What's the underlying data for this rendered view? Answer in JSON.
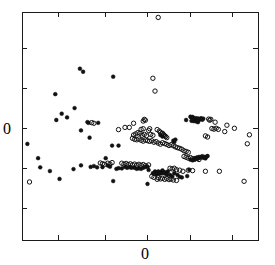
{
  "chart_data": {
    "type": "scatter",
    "title": "",
    "subtitle": "",
    "xlabel": "",
    "ylabel": "",
    "xlim": [
      -3,
      2
    ],
    "ylim": [
      -2,
      3
    ],
    "grid": false,
    "legend_position": "none",
    "xticks": [
      -3,
      -2,
      -1,
      0,
      1
    ],
    "xtick_labels": [
      "",
      "",
      "",
      "0",
      ""
    ],
    "yticks": [
      2,
      1,
      0,
      -1,
      -2
    ],
    "ytick_labels": [
      "",
      "",
      "0",
      "",
      ""
    ],
    "axis_frame": "box",
    "tick_direction": "in",
    "x_axis_label_value": "0",
    "y_axis_label_value": "0",
    "marker_colors": {
      "filled": "#111111",
      "open": "#111111"
    },
    "series": [
      {
        "name": "filled",
        "marker": "filled-circle",
        "points": [
          [
            -1.773,
            1.757
          ],
          [
            -1.705,
            1.69
          ],
          [
            -1.068,
            1.581
          ],
          [
            -2.295,
            1.199
          ],
          [
            -1.886,
            0.893
          ],
          [
            -2.159,
            0.77
          ],
          [
            -2.045,
            0.689
          ],
          [
            -2.273,
            0.632
          ],
          [
            -1.614,
            0.585
          ],
          [
            -1.591,
            0.57
          ],
          [
            -1.386,
            0.57
          ],
          [
            -1.75,
            0.403
          ],
          [
            -1.568,
            0.245
          ],
          [
            -2.886,
            0.108
          ],
          [
            -1.091,
            0.07
          ],
          [
            -0.955,
            0.07
          ],
          [
            -2.659,
            -0.206
          ],
          [
            -2.614,
            -0.407
          ],
          [
            -1.909,
            -0.445
          ],
          [
            -2.409,
            -0.488
          ],
          [
            -1.227,
            -0.206
          ],
          [
            -1.75,
            -0.363
          ],
          [
            -1.545,
            -0.397
          ],
          [
            -1.477,
            -0.378
          ],
          [
            -1.409,
            -0.406
          ],
          [
            -1.295,
            -0.402
          ],
          [
            -1.182,
            -0.368
          ],
          [
            -1.136,
            -0.392
          ],
          [
            -1.0,
            -0.44
          ],
          [
            -0.955,
            -0.425
          ],
          [
            -0.886,
            -0.43
          ],
          [
            -0.818,
            -0.397
          ],
          [
            -0.773,
            -0.416
          ],
          [
            -0.727,
            -0.402
          ],
          [
            -0.682,
            -0.416
          ],
          [
            -0.614,
            -0.416
          ],
          [
            -0.568,
            -0.44
          ],
          [
            -0.523,
            -0.426
          ],
          [
            -0.477,
            -0.44
          ],
          [
            -0.432,
            -0.416
          ],
          [
            -0.386,
            -0.397
          ],
          [
            -0.341,
            -0.392
          ],
          [
            -2.205,
            -0.66
          ],
          [
            -1.068,
            -0.707
          ],
          [
            -0.318,
            -0.464
          ],
          [
            -0.227,
            -0.536
          ],
          [
            -0.182,
            -0.498
          ],
          [
            -0.159,
            -0.56
          ],
          [
            -0.136,
            -0.522
          ],
          [
            -0.114,
            -0.498
          ],
          [
            -0.091,
            -0.55
          ],
          [
            -0.068,
            -0.507
          ],
          [
            -0.045,
            -0.536
          ],
          [
            -0.023,
            -0.474
          ],
          [
            0.0,
            -0.512
          ],
          [
            0.023,
            -0.541
          ],
          [
            0.045,
            -0.517
          ],
          [
            0.068,
            -0.565
          ],
          [
            0.091,
            -0.498
          ],
          [
            0.136,
            -0.574
          ],
          [
            0.182,
            -0.603
          ],
          [
            0.227,
            -0.536
          ],
          [
            0.295,
            -0.574
          ],
          [
            0.341,
            -0.617
          ],
          [
            -0.341,
            -0.77
          ],
          [
            0.386,
            -0.627
          ],
          [
            0.5,
            -0.598
          ],
          [
            0.545,
            -0.459
          ],
          [
            0.568,
            -0.239
          ],
          [
            0.614,
            -0.253
          ],
          [
            0.636,
            -0.234
          ],
          [
            0.659,
            -0.206
          ],
          [
            0.682,
            -0.22
          ],
          [
            0.705,
            -0.191
          ],
          [
            0.727,
            -0.215
          ],
          [
            0.75,
            -0.177
          ],
          [
            0.773,
            -0.196
          ],
          [
            0.795,
            -0.182
          ],
          [
            0.818,
            -0.163
          ],
          [
            0.841,
            -0.196
          ],
          [
            0.864,
            -0.177
          ],
          [
            0.886,
            -0.211
          ],
          [
            0.909,
            -0.172
          ],
          [
            0.932,
            -0.158
          ],
          [
            0.568,
            0.704
          ],
          [
            0.591,
            0.68
          ],
          [
            0.614,
            0.699
          ],
          [
            0.636,
            0.675
          ],
          [
            0.659,
            0.646
          ],
          [
            0.682,
            0.67
          ],
          [
            0.705,
            0.651
          ],
          [
            0.727,
            0.665
          ],
          [
            0.75,
            0.632
          ],
          [
            0.773,
            0.656
          ],
          [
            0.795,
            0.67
          ],
          [
            0.818,
            0.637
          ],
          [
            0.841,
            0.661
          ],
          [
            0.636,
            0.608
          ],
          [
            0.591,
            0.613
          ],
          [
            0.682,
            0.603
          ],
          [
            0.727,
            0.584
          ],
          [
            -0.068,
            0.302
          ],
          [
            -0.023,
            0.268
          ],
          [
            0.205,
            0.178
          ],
          [
            0.227,
            0.15
          ],
          [
            0.25,
            0.202
          ],
          [
            0.477,
            0.632
          ]
        ]
      },
      {
        "name": "open",
        "marker": "open-circle",
        "points": [
          [
            -0.114,
            2.881
          ],
          [
            -0.227,
            1.547
          ],
          [
            -0.182,
            1.266
          ],
          [
            -2.841,
            -0.727
          ],
          [
            -1.523,
            0.574
          ],
          [
            -1.477,
            0.56
          ],
          [
            -0.432,
            0.608
          ],
          [
            -0.409,
            0.646
          ],
          [
            -0.386,
            0.627
          ],
          [
            -0.636,
            0.56
          ],
          [
            -0.818,
            0.469
          ],
          [
            -0.727,
            0.469
          ],
          [
            -0.955,
            0.421
          ],
          [
            -0.477,
            0.426
          ],
          [
            -0.432,
            0.44
          ],
          [
            -0.295,
            0.44
          ],
          [
            -0.318,
            0.402
          ],
          [
            -0.545,
            0.355
          ],
          [
            -0.5,
            0.34
          ],
          [
            -0.591,
            0.326
          ],
          [
            -0.636,
            0.302
          ],
          [
            -0.455,
            0.297
          ],
          [
            -0.409,
            0.316
          ],
          [
            -0.364,
            0.287
          ],
          [
            -0.273,
            0.316
          ],
          [
            -0.227,
            0.297
          ],
          [
            -0.136,
            0.421
          ],
          [
            -0.091,
            0.388
          ],
          [
            -0.068,
            0.359
          ],
          [
            -0.045,
            0.33
          ],
          [
            -0.023,
            0.34
          ],
          [
            0.0,
            0.311
          ],
          [
            0.023,
            0.287
          ],
          [
            0.045,
            0.268
          ],
          [
            0.068,
            0.244
          ],
          [
            -0.659,
            0.23
          ],
          [
            -0.614,
            0.206
          ],
          [
            -0.568,
            0.197
          ],
          [
            -0.523,
            0.216
          ],
          [
            -0.477,
            0.187
          ],
          [
            -0.432,
            0.168
          ],
          [
            -0.386,
            0.192
          ],
          [
            -0.341,
            0.178
          ],
          [
            -0.295,
            0.163
          ],
          [
            -0.25,
            0.178
          ],
          [
            -0.205,
            0.144
          ],
          [
            -0.159,
            0.158
          ],
          [
            -0.114,
            0.125
          ],
          [
            -0.068,
            0.101
          ],
          [
            -0.023,
            0.134
          ],
          [
            0.023,
            0.115
          ],
          [
            0.068,
            0.096
          ],
          [
            0.114,
            0.072
          ],
          [
            0.159,
            0.091
          ],
          [
            0.205,
            0.067
          ],
          [
            0.25,
            0.043
          ],
          [
            0.295,
            0.024
          ],
          [
            0.341,
            0.01
          ],
          [
            0.386,
            -0.01
          ],
          [
            0.432,
            -0.043
          ],
          [
            0.477,
            -0.058
          ],
          [
            0.523,
            -0.077
          ],
          [
            0.432,
            -0.168
          ],
          [
            0.477,
            -0.187
          ],
          [
            0.523,
            -0.206
          ],
          [
            0.568,
            -0.192
          ],
          [
            0.614,
            -0.216
          ],
          [
            0.659,
            -0.23
          ],
          [
            0.705,
            -0.211
          ],
          [
            0.75,
            -0.235
          ],
          [
            1.091,
            0.584
          ],
          [
            1.023,
            0.445
          ],
          [
            1.068,
            0.431
          ],
          [
            1.114,
            0.45
          ],
          [
            1.159,
            0.426
          ],
          [
            1.341,
            0.517
          ],
          [
            1.295,
            0.378
          ],
          [
            1.5,
            0.45
          ],
          [
            0.955,
            0.651
          ],
          [
            0.977,
            0.627
          ],
          [
            1.0,
            0.646
          ],
          [
            1.818,
            0.307
          ],
          [
            1.773,
            0.11
          ],
          [
            0.886,
            0.283
          ],
          [
            0.932,
            0.259
          ],
          [
            -1.341,
            -0.311
          ],
          [
            -1.295,
            -0.326
          ],
          [
            -1.25,
            -0.34
          ],
          [
            -1.182,
            -0.316
          ],
          [
            -1.136,
            -0.335
          ],
          [
            -1.091,
            -0.302
          ],
          [
            -0.886,
            -0.316
          ],
          [
            -0.841,
            -0.34
          ],
          [
            -0.795,
            -0.321
          ],
          [
            -0.75,
            -0.345
          ],
          [
            -0.705,
            -0.33
          ],
          [
            -0.659,
            -0.354
          ],
          [
            -0.614,
            -0.335
          ],
          [
            -0.568,
            -0.359
          ],
          [
            -0.523,
            -0.34
          ],
          [
            -0.477,
            -0.364
          ],
          [
            -0.432,
            -0.345
          ],
          [
            -0.386,
            -0.369
          ],
          [
            -0.318,
            -0.354
          ],
          [
            0.136,
            -0.426
          ],
          [
            0.182,
            -0.44
          ],
          [
            0.227,
            -0.426
          ],
          [
            0.273,
            -0.459
          ],
          [
            0.341,
            -0.469
          ],
          [
            0.409,
            -0.493
          ],
          [
            0.523,
            -0.469
          ],
          [
            0.614,
            -0.478
          ],
          [
            -0.136,
            -0.67
          ],
          [
            -0.114,
            -0.636
          ],
          [
            -0.068,
            -0.66
          ],
          [
            -0.023,
            -0.646
          ],
          [
            0.023,
            -0.67
          ],
          [
            0.068,
            -0.651
          ],
          [
            0.114,
            -0.675
          ],
          [
            0.159,
            -0.66
          ],
          [
            0.205,
            -0.684
          ],
          [
            0.273,
            -0.694
          ],
          [
            -0.25,
            -0.603
          ],
          [
            -0.205,
            -0.627
          ],
          [
            0.886,
            -0.493
          ],
          [
            1.182,
            -0.493
          ],
          [
            1.705,
            -0.713
          ]
        ]
      }
    ]
  },
  "plot_geometry": {
    "frame_left_px": 22,
    "frame_right_px": 258,
    "frame_top_px": 12,
    "frame_bottom_px": 240,
    "x_tick_px": [
      58,
      105,
      147,
      190,
      232
    ],
    "y_tick_px": [
      48,
      88,
      128,
      168,
      208
    ],
    "x_label_px": [
      147,
      256
    ],
    "y_label_px": [
      8,
      128
    ]
  }
}
